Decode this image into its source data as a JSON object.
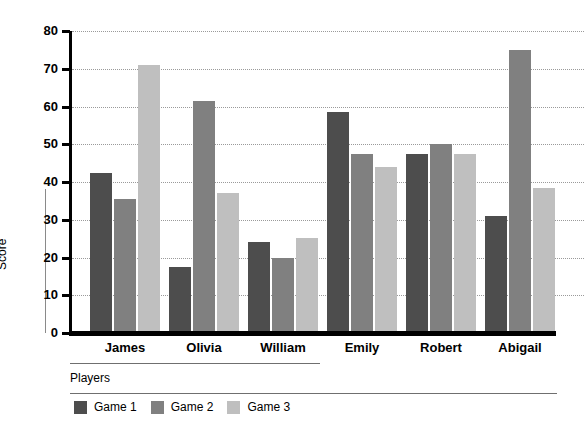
{
  "chart_data": {
    "type": "bar",
    "title": "",
    "xlabel": "Players",
    "ylabel": "Score",
    "categories": [
      "James",
      "Olivia",
      "William",
      "Emily",
      "Robert",
      "Abigail"
    ],
    "series": [
      {
        "name": "Game 1",
        "color": "#4d4d4d",
        "values": [
          42.5,
          17.5,
          24.0,
          58.5,
          47.5,
          31.0
        ]
      },
      {
        "name": "Game 2",
        "color": "#808080",
        "values": [
          35.5,
          61.5,
          19.8,
          47.5,
          50.0,
          75.0
        ]
      },
      {
        "name": "Game 3",
        "color": "#bfbfbf",
        "values": [
          71.0,
          37.0,
          25.3,
          44.0,
          47.3,
          38.5
        ]
      }
    ],
    "ylim": [
      0,
      80
    ],
    "yticks": [
      0,
      10,
      20,
      30,
      40,
      50,
      60,
      70,
      80
    ],
    "ytick_labels": [
      "0",
      "10",
      "20",
      "30",
      "40",
      "50",
      "60",
      "70",
      "80"
    ],
    "grid": true,
    "grid_style": "dotted",
    "legend_position": "bottom-left",
    "legend_entries": [
      "Game 1",
      "Game 2",
      "Game 3"
    ],
    "background": "#ffffff",
    "axis_color": "#000000"
  }
}
